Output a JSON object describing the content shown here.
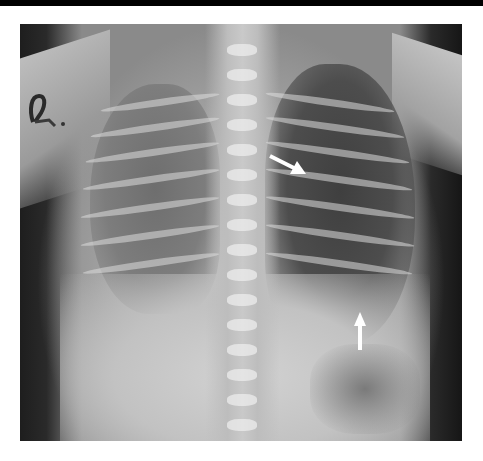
{
  "image": {
    "type": "chest-radiograph",
    "view": "frontal",
    "colors": {
      "top_bar": "#000000",
      "margin": "#ffffff",
      "arrow": "#ffffff"
    },
    "annotations": [
      {
        "name": "arrow-upper",
        "direction": "down-right",
        "position": {
          "x": 268,
          "y": 158
        }
      },
      {
        "name": "arrow-lower",
        "direction": "up",
        "position": {
          "x": 362,
          "y": 318
        }
      }
    ]
  }
}
